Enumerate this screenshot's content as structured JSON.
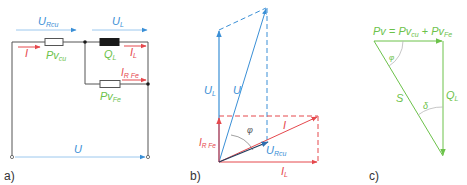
{
  "colors": {
    "blue": "#3a8fd6",
    "red": "#e5484d",
    "green": "#6cc24a",
    "wire": "#555555",
    "black": "#1a1a1a",
    "arc": "#b8b8b8"
  },
  "panel_a": {
    "label": "a)",
    "u_rcu": {
      "main": "U",
      "sub": "Rcu"
    },
    "u_l": {
      "main": "U",
      "sub": "L"
    },
    "i": {
      "main": "I",
      "sub": ""
    },
    "pv_cu": {
      "main": "Pv",
      "sub": "cu"
    },
    "q_l": {
      "main": "Q",
      "sub": "L"
    },
    "i_l": {
      "main": "I",
      "sub": "L"
    },
    "i_rfe": {
      "main": "I",
      "sub": "R Fe"
    },
    "pv_fe": {
      "main": "Pv",
      "sub": "Fe"
    },
    "u": {
      "main": "U",
      "sub": ""
    }
  },
  "panel_b": {
    "label": "b)",
    "u_l": {
      "main": "U",
      "sub": "L"
    },
    "u": {
      "main": "U",
      "sub": ""
    },
    "phi": "φ",
    "i_rfe": {
      "main": "I",
      "sub": "R Fe"
    },
    "i": {
      "main": "I",
      "sub": ""
    },
    "u_rcu": {
      "main": "U",
      "sub": "Rcu"
    },
    "i_l": {
      "main": "I",
      "sub": "L"
    }
  },
  "panel_c": {
    "label": "c)",
    "formula": {
      "pv": "Pv",
      "eq": " = ",
      "pv1": "Pv",
      "sub1": "cu",
      "plus": " + ",
      "pv2": "Pv",
      "sub2": "Fe"
    },
    "alpha": "φ",
    "s": {
      "main": "S",
      "sub": ""
    },
    "delta": "δ",
    "q_l": {
      "main": "Q",
      "sub": "L"
    }
  }
}
